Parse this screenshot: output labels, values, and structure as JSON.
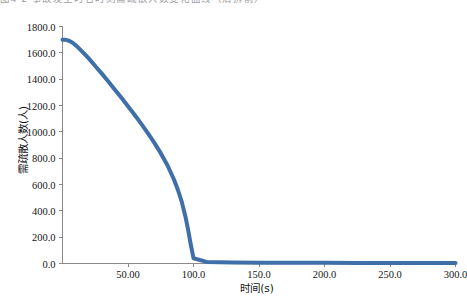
{
  "caption": {
    "text": "图4-2 事故发生时各时刻需疏散人数变化曲线（清拆前）"
  },
  "chart_data": {
    "type": "line",
    "title": "",
    "xlabel": "时间(s)",
    "ylabel": "需疏散人数(人)",
    "xlim": [
      0,
      300
    ],
    "ylim": [
      0,
      1800
    ],
    "grid": false,
    "legend": "none",
    "line_color": "#3f6fa8",
    "line_width": 4,
    "xticks": [
      50,
      100,
      150,
      200,
      250,
      300
    ],
    "xtick_labels": [
      "50.00",
      "100.0",
      "150.0",
      "200.0",
      "250.0",
      "300.0"
    ],
    "yticks": [
      0,
      200,
      400,
      600,
      800,
      1000,
      1200,
      1400,
      1600,
      1800
    ],
    "ytick_labels": [
      "0.0",
      "200.0",
      "400.0",
      "600.0",
      "800.0",
      "1000.0",
      "1200.0",
      "1400.0",
      "1600.0",
      "1800.0"
    ],
    "series": [
      {
        "name": "需疏散人数",
        "x": [
          0,
          2,
          5,
          8,
          12,
          16,
          20,
          25,
          30,
          35,
          40,
          45,
          50,
          55,
          60,
          65,
          70,
          75,
          80,
          85,
          88,
          91,
          94,
          96,
          98,
          100,
          110,
          130,
          150,
          175,
          200,
          225,
          250,
          275,
          300
        ],
        "y": [
          1700,
          1700,
          1692,
          1675,
          1640,
          1600,
          1558,
          1500,
          1442,
          1382,
          1320,
          1258,
          1195,
          1130,
          1062,
          992,
          918,
          838,
          748,
          640,
          562,
          470,
          350,
          250,
          140,
          40,
          12,
          8,
          6,
          5,
          5,
          4,
          4,
          4,
          4
        ]
      }
    ],
    "annotations": []
  },
  "axis_style": {
    "axis_color": "#8a8a8a",
    "tick_color": "#8a8a8a",
    "text_color": "#161616"
  }
}
